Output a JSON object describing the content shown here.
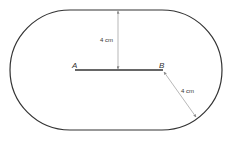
{
  "diagram": {
    "points": {
      "a": "A",
      "b": "B"
    },
    "measurements": {
      "vertical": "4 cm",
      "diagonal": "4 cm"
    },
    "colors": {
      "stroke": "#333333",
      "arrow": "#888888"
    }
  }
}
